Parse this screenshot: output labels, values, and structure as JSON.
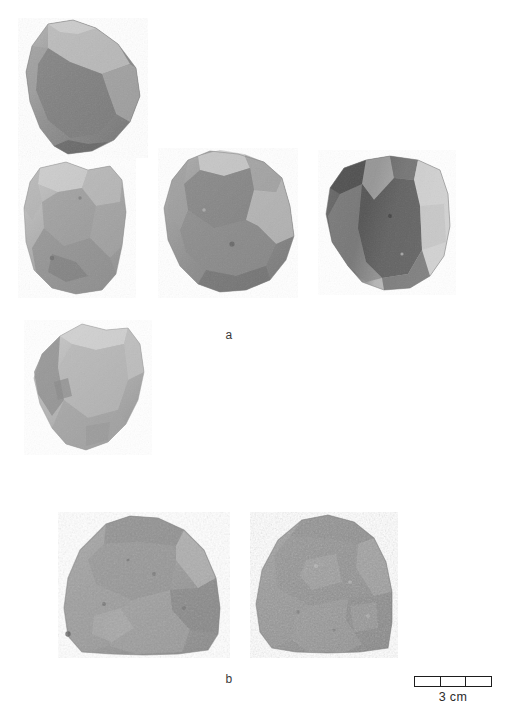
{
  "figure": {
    "background_color": "#ffffff",
    "width": 517,
    "height": 721
  },
  "panels": [
    {
      "id": "a",
      "label": "a",
      "label_x": 219,
      "label_y": 329
    },
    {
      "id": "b",
      "label": "b",
      "label_y": 673,
      "label_x": 219
    }
  ],
  "scale": {
    "caption": "3 cm",
    "segments": 3,
    "segment_values": [
      "1",
      "2",
      "3"
    ],
    "units": "cm",
    "total_length_cm": 3,
    "bar_color": "#1d1d1d",
    "fill_color": "#ffffff"
  },
  "artifacts": [
    {
      "id": "artifact-1",
      "panel": "a",
      "position": "top-left",
      "x": 18,
      "y": 18,
      "w": 130,
      "h": 140,
      "base_color": "#8d8d8d",
      "light_color": "#bdbdbd",
      "dark_color": "#666666",
      "note": "angular core, lighter upper-right facet, darker lower body"
    },
    {
      "id": "artifact-2",
      "panel": "a",
      "position": "row2-left",
      "x": 18,
      "y": 158,
      "w": 118,
      "h": 140,
      "base_color": "#a5a5a5",
      "light_color": "#c9c9c9",
      "dark_color": "#7d7d7d",
      "note": "pale grey quadrangular core with multiple flake scars"
    },
    {
      "id": "artifact-3",
      "panel": "a",
      "position": "row2-center",
      "x": 158,
      "y": 148,
      "w": 140,
      "h": 150,
      "base_color": "#8f8f8f",
      "light_color": "#c4c4c4",
      "dark_color": "#6e6e6e",
      "note": "mid-grey core, bright facet upper-left and right margin"
    },
    {
      "id": "artifact-4",
      "panel": "a",
      "position": "row2-right",
      "x": 318,
      "y": 150,
      "w": 138,
      "h": 145,
      "base_color": "#8a8a8a",
      "light_color": "#cfcfcf",
      "dark_color": "#4f4f4f",
      "note": "high-contrast core, dark left-central band, bright right half"
    },
    {
      "id": "artifact-5",
      "panel": "a",
      "position": "row3-left",
      "x": 24,
      "y": 320,
      "w": 128,
      "h": 135,
      "base_color": "#b0b0b0",
      "light_color": "#cdcdcd",
      "dark_color": "#8a8a8a",
      "note": "light grey core tilted, shadowed left edge"
    },
    {
      "id": "artifact-6",
      "panel": "b",
      "position": "bottom-left",
      "x": 58,
      "y": 512,
      "w": 172,
      "h": 145,
      "base_color": "#9b9b9b",
      "light_color": "#c2c2c2",
      "dark_color": "#7a7a7a",
      "note": "dome-shaped cobble tool, coarse mottled surface"
    },
    {
      "id": "artifact-7",
      "panel": "b",
      "position": "bottom-right",
      "x": 250,
      "y": 512,
      "w": 148,
      "h": 145,
      "base_color": "#969696",
      "light_color": "#bcbcbc",
      "dark_color": "#757575",
      "note": "dome-shaped cobble tool, granular speckled cortex"
    }
  ]
}
